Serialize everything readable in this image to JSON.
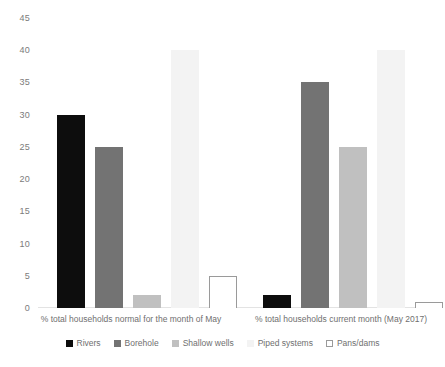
{
  "chart_data": {
    "type": "bar",
    "title": "",
    "xlabel": "",
    "ylabel": "",
    "ylim": [
      0,
      45
    ],
    "yticks": [
      0,
      5,
      10,
      15,
      20,
      25,
      30,
      35,
      40,
      45
    ],
    "grid": false,
    "legend_position": "bottom",
    "categories": [
      "% total households normal for the month of May",
      "% total households current month (May 2017)"
    ],
    "series": [
      {
        "name": "Rivers",
        "values": [
          30,
          2
        ],
        "color": "#0d0d0d",
        "border": "#0d0d0d"
      },
      {
        "name": "Borehole",
        "values": [
          25,
          35
        ],
        "color": "#737373",
        "border": "#737373"
      },
      {
        "name": "Shallow wells",
        "values": [
          2,
          25
        ],
        "color": "#c0c0c0",
        "border": "#c0c0c0"
      },
      {
        "name": "Piped systems",
        "values": [
          40,
          40
        ],
        "color": "#f3f3f3",
        "border": "#f3f3f3"
      },
      {
        "name": "Pans/dams",
        "values": [
          5,
          1
        ],
        "color": "#ffffff",
        "border": "#9a9a9a"
      }
    ]
  },
  "axis": {
    "ticks": [
      "45",
      "40",
      "35",
      "30",
      "25",
      "20",
      "15",
      "10",
      "5",
      "0"
    ]
  },
  "legend": {
    "items": [
      {
        "label": "Rivers"
      },
      {
        "label": "Borehole"
      },
      {
        "label": "Shallow wells"
      },
      {
        "label": "Piped systems"
      },
      {
        "label": "Pans/dams"
      }
    ]
  }
}
